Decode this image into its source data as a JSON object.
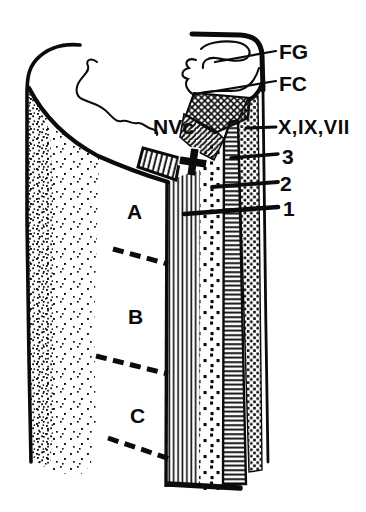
{
  "figure": {
    "type": "hand-drawn embryology cross-section diagram",
    "ink_color": "#0b0b0b",
    "background": "#ffffff",
    "labels": {
      "fg": "FG",
      "fc": "FC",
      "nerves": "X,IX,VII",
      "band3": "3",
      "band2": "2",
      "band1": "1",
      "nvc": "NVc",
      "regionA": "A",
      "regionB": "B",
      "regionC": "C"
    }
  }
}
